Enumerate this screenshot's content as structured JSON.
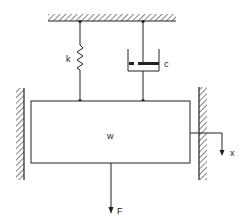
{
  "diagram": {
    "labels": {
      "spring": "k",
      "damper": "c",
      "mass": "w",
      "force": "F",
      "displacement": "x"
    },
    "components": [
      {
        "type": "ceiling",
        "role": "fixed support"
      },
      {
        "type": "spring",
        "label": "k"
      },
      {
        "type": "damper",
        "label": "c"
      },
      {
        "type": "mass",
        "label": "w"
      },
      {
        "type": "wall-left",
        "role": "guide"
      },
      {
        "type": "wall-right",
        "role": "guide"
      },
      {
        "type": "force-arrow",
        "label": "F",
        "direction": "down"
      },
      {
        "type": "displacement-arrow",
        "label": "x",
        "direction": "down"
      }
    ],
    "colors": {
      "stroke": "#222222",
      "background": "#ffffff"
    }
  }
}
